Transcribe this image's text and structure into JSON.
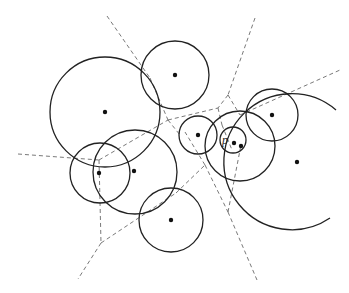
{
  "diagram": {
    "label": "p",
    "label_position": {
      "x": 222,
      "y": 144
    },
    "colors": {
      "circle": "#222222",
      "edge": "#6a6a6a",
      "site": "#111111",
      "background": "#ffffff"
    },
    "circles": [
      {
        "cx": 105,
        "cy": 112,
        "r": 55
      },
      {
        "cx": 175,
        "cy": 75,
        "r": 34
      },
      {
        "cx": 135,
        "cy": 172,
        "r": 42
      },
      {
        "cx": 100,
        "cy": 173,
        "r": 30
      },
      {
        "cx": 171,
        "cy": 220,
        "r": 32
      },
      {
        "cx": 198,
        "cy": 135,
        "r": 19
      },
      {
        "cx": 233,
        "cy": 140,
        "r": 13
      },
      {
        "cx": 240,
        "cy": 146,
        "r": 35
      },
      {
        "cx": 272,
        "cy": 115,
        "r": 26
      }
    ],
    "arc": {
      "d": "M 336 110 A 68 68 0 1 0 330 218"
    },
    "sites": [
      {
        "x": 105,
        "y": 112
      },
      {
        "x": 175,
        "y": 75
      },
      {
        "x": 134,
        "y": 171
      },
      {
        "x": 99,
        "y": 173
      },
      {
        "x": 171,
        "y": 220
      },
      {
        "x": 198,
        "y": 135
      },
      {
        "x": 234,
        "y": 143
      },
      {
        "x": 241,
        "y": 146
      },
      {
        "x": 272,
        "y": 115
      },
      {
        "x": 297,
        "y": 162
      }
    ],
    "edges": [
      [
        107,
        16,
        150,
        78
      ],
      [
        150,
        78,
        168,
        120
      ],
      [
        255,
        18,
        228,
        95
      ],
      [
        228,
        95,
        218,
        108
      ],
      [
        168,
        120,
        218,
        108
      ],
      [
        218,
        108,
        222,
        125
      ],
      [
        228,
        95,
        240,
        115
      ],
      [
        240,
        115,
        340,
        70
      ],
      [
        18,
        154,
        99,
        160
      ],
      [
        99,
        160,
        168,
        120
      ],
      [
        168,
        120,
        180,
        135
      ],
      [
        99,
        160,
        101,
        243
      ],
      [
        101,
        243,
        78,
        279
      ],
      [
        101,
        243,
        176,
        193
      ],
      [
        176,
        193,
        205,
        165
      ],
      [
        205,
        165,
        185,
        132
      ],
      [
        205,
        165,
        228,
        212
      ],
      [
        228,
        212,
        241,
        145
      ],
      [
        228,
        212,
        257,
        280
      ],
      [
        222,
        125,
        232,
        150
      ]
    ]
  }
}
